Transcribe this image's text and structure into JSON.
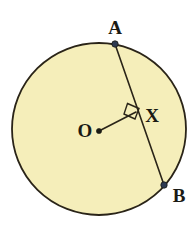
{
  "figure": {
    "background_color": "#ffffff",
    "stroke_color": "#2a2418",
    "fill_color": "#f5eeba",
    "point_color": "#2d3a52"
  },
  "circle": {
    "name": "circle-O",
    "center_x": 99,
    "center_y": 129,
    "radius_x": 87,
    "radius_y": 86,
    "stroke_width": 1.8
  },
  "chord": {
    "name": "chord-AB",
    "x1": 115,
    "y1": 44,
    "x2": 164,
    "y2": 185,
    "stroke_width": 1.6
  },
  "radius_segment": {
    "name": "segment-OX",
    "x1": 99,
    "y1": 131,
    "x2": 136,
    "y2": 112,
    "stroke_width": 1.6
  },
  "right_angle": {
    "name": "right-angle-marker",
    "points": "127.5,103.5 139.0,108.5 135.0,119.0 124.0,114.0",
    "stroke_width": 1.4
  },
  "points": [
    {
      "id": "A",
      "name": "point-a",
      "cx": 115,
      "cy": 44,
      "r": 3.2
    },
    {
      "id": "O",
      "name": "point-o",
      "cx": 99,
      "cy": 131,
      "r": 2.6
    },
    {
      "id": "B",
      "name": "point-b",
      "cx": 164,
      "cy": 185,
      "r": 3.2
    }
  ],
  "labels": {
    "a": {
      "text": "A",
      "x": 115,
      "y": 27
    },
    "o": {
      "text": "O",
      "x": 85,
      "y": 130
    },
    "x": {
      "text": "X",
      "x": 152,
      "y": 115
    },
    "b": {
      "text": "B",
      "x": 179,
      "y": 195
    }
  }
}
